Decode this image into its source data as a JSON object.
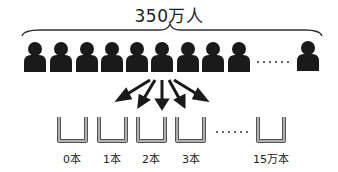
{
  "title": "350万人",
  "people": {
    "count_shown": 10,
    "ellipsis": "……"
  },
  "cups": {
    "labels": [
      "0本",
      "1本",
      "2本",
      "3本",
      "15万本"
    ],
    "ellipsis": "……"
  },
  "colors": {
    "ink": "#222222",
    "cup": "#777777"
  }
}
